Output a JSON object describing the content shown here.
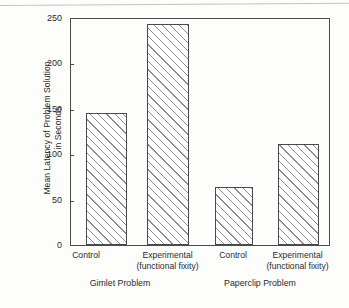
{
  "chart_data": {
    "type": "bar",
    "title": "",
    "xlabel": "",
    "ylabel": "Mean Latency of Problem Solution in Seconds",
    "ylabel_line1": "Mean Latency of Problem Solution",
    "ylabel_line2": "in Seconds",
    "ylim": [
      0,
      250
    ],
    "ytick_labels": [
      "0",
      "50",
      "100",
      "150",
      "200",
      "250"
    ],
    "ytick_values": [
      0,
      50,
      100,
      150,
      200,
      250
    ],
    "grid": false,
    "legend": "none",
    "categories": [
      "Control",
      "Experimental (functional fixity)",
      "Control",
      "Experimental (functional fixity)"
    ],
    "values": [
      146,
      244,
      64,
      112
    ],
    "groups": [
      {
        "name": "Gimlet Problem",
        "bars": [
          {
            "label_line1": "Control",
            "label_line2": "",
            "value": 146
          },
          {
            "label_line1": "Experimental",
            "label_line2": "(functional fixity)",
            "value": 244
          }
        ]
      },
      {
        "name": "Paperclip Problem",
        "bars": [
          {
            "label_line1": "Control",
            "label_line2": "",
            "value": 64
          },
          {
            "label_line1": "Experimental",
            "label_line2": "(functional fixity)",
            "value": 112
          }
        ]
      }
    ],
    "bar_style": {
      "fill": "#ffffff",
      "hatch": "diagonal-45",
      "hatch_color": "#8d8d8a",
      "edge_color": "#4a4a4a"
    },
    "axis_color": "#4a4a4a",
    "background_color": "#fdfdfb"
  },
  "bars": [
    {
      "name": "gimlet-control",
      "label_line1": "Control",
      "label_line2": "",
      "value": 146
    },
    {
      "name": "gimlet-experimental",
      "label_line1": "Experimental",
      "label_line2": "(functional fixity)",
      "value": 244
    },
    {
      "name": "paperclip-control",
      "label_line1": "Control",
      "label_line2": "",
      "value": 64
    },
    {
      "name": "paperclip-experimental",
      "label_line1": "Experimental",
      "label_line2": "(functional fixity)",
      "value": 112
    }
  ],
  "yticks": [
    {
      "label": "250"
    },
    {
      "label": "200"
    },
    {
      "label": "150"
    },
    {
      "label": "100"
    },
    {
      "label": "50"
    },
    {
      "label": "0"
    }
  ],
  "groups": [
    {
      "name": "Gimlet Problem"
    },
    {
      "name": "Paperclip Problem"
    }
  ]
}
